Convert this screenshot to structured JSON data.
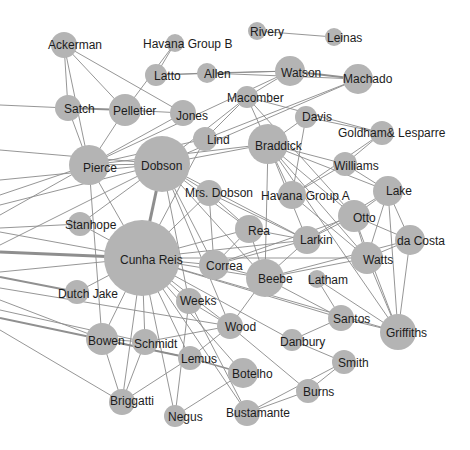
{
  "chart_data": {
    "type": "network",
    "title": "",
    "node_color": "#b4b4b4",
    "edge_color": "#8a8a8a",
    "label_color": "#1c1c1c",
    "nodes": [
      {
        "id": "Ackerman",
        "x": 64,
        "y": 45,
        "r": 13,
        "lx": 48,
        "ly": 49
      },
      {
        "id": "Havana Group B",
        "x": 175,
        "y": 43,
        "r": 9,
        "lx": 143,
        "ly": 48
      },
      {
        "id": "Rivery",
        "x": 257,
        "y": 31,
        "r": 9,
        "lx": 250,
        "ly": 36
      },
      {
        "id": "Leinas",
        "x": 334,
        "y": 37,
        "r": 9,
        "lx": 327,
        "ly": 42
      },
      {
        "id": "Latto",
        "x": 156,
        "y": 75,
        "r": 11,
        "lx": 154,
        "ly": 80
      },
      {
        "id": "Allen",
        "x": 207,
        "y": 73,
        "r": 10,
        "lx": 204,
        "ly": 78
      },
      {
        "id": "Watson",
        "x": 290,
        "y": 71,
        "r": 15,
        "lx": 281,
        "ly": 77
      },
      {
        "id": "Machado",
        "x": 358,
        "y": 79,
        "r": 15,
        "lx": 343,
        "ly": 83
      },
      {
        "id": "Satch",
        "x": 68,
        "y": 108,
        "r": 13,
        "lx": 64,
        "ly": 113
      },
      {
        "id": "Pelletier",
        "x": 125,
        "y": 110,
        "r": 16,
        "lx": 113,
        "ly": 115
      },
      {
        "id": "Jones",
        "x": 183,
        "y": 113,
        "r": 13,
        "lx": 176,
        "ly": 120
      },
      {
        "id": "Macomber",
        "x": 247,
        "y": 97,
        "r": 11,
        "lx": 227,
        "ly": 102
      },
      {
        "id": "Lind",
        "x": 205,
        "y": 139,
        "r": 12,
        "lx": 207,
        "ly": 144
      },
      {
        "id": "Davis",
        "x": 306,
        "y": 117,
        "r": 11,
        "lx": 302,
        "ly": 121
      },
      {
        "id": "Goldham& Lesparre",
        "x": 382,
        "y": 133,
        "r": 12,
        "lx": 338,
        "ly": 137
      },
      {
        "id": "Pierce",
        "x": 89,
        "y": 165,
        "r": 20,
        "lx": 83,
        "ly": 172
      },
      {
        "id": "Dobson",
        "x": 162,
        "y": 164,
        "r": 28,
        "lx": 141,
        "ly": 170
      },
      {
        "id": "Braddick",
        "x": 268,
        "y": 144,
        "r": 20,
        "lx": 255,
        "ly": 150
      },
      {
        "id": "Williams",
        "x": 345,
        "y": 164,
        "r": 12,
        "lx": 334,
        "ly": 170
      },
      {
        "id": "Mrs. Dobson",
        "x": 209,
        "y": 193,
        "r": 13,
        "lx": 185,
        "ly": 197
      },
      {
        "id": "Havana Group A",
        "x": 292,
        "y": 195,
        "r": 14,
        "lx": 261,
        "ly": 200
      },
      {
        "id": "Lake",
        "x": 388,
        "y": 191,
        "r": 15,
        "lx": 386,
        "ly": 195
      },
      {
        "id": "Stanhope",
        "x": 80,
        "y": 224,
        "r": 12,
        "lx": 65,
        "ly": 229
      },
      {
        "id": "Rea",
        "x": 249,
        "y": 229,
        "r": 14,
        "lx": 248,
        "ly": 235
      },
      {
        "id": "Otto",
        "x": 354,
        "y": 216,
        "r": 16,
        "lx": 353,
        "ly": 222
      },
      {
        "id": "Larkin",
        "x": 307,
        "y": 240,
        "r": 14,
        "lx": 300,
        "ly": 244
      },
      {
        "id": "da Costa",
        "x": 410,
        "y": 240,
        "r": 15,
        "lx": 397,
        "ly": 245
      },
      {
        "id": "Cunha Reis",
        "x": 142,
        "y": 258,
        "r": 38,
        "lx": 120,
        "ly": 264
      },
      {
        "id": "Correa",
        "x": 214,
        "y": 265,
        "r": 15,
        "lx": 206,
        "ly": 270
      },
      {
        "id": "Watts",
        "x": 367,
        "y": 258,
        "r": 16,
        "lx": 363,
        "ly": 264
      },
      {
        "id": "Beebe",
        "x": 265,
        "y": 278,
        "r": 19,
        "lx": 258,
        "ly": 283
      },
      {
        "id": "Latham",
        "x": 317,
        "y": 279,
        "r": 9,
        "lx": 308,
        "ly": 284
      },
      {
        "id": "Dutch Jake",
        "x": 77,
        "y": 292,
        "r": 12,
        "lx": 58,
        "ly": 298
      },
      {
        "id": "Weeks",
        "x": 189,
        "y": 301,
        "r": 13,
        "lx": 180,
        "ly": 305
      },
      {
        "id": "Santos",
        "x": 341,
        "y": 318,
        "r": 13,
        "lx": 333,
        "ly": 323
      },
      {
        "id": "Griffiths",
        "x": 398,
        "y": 332,
        "r": 18,
        "lx": 386,
        "ly": 337
      },
      {
        "id": "Wood",
        "x": 230,
        "y": 326,
        "r": 13,
        "lx": 225,
        "ly": 331
      },
      {
        "id": "Danbury",
        "x": 292,
        "y": 340,
        "r": 11,
        "lx": 280,
        "ly": 346
      },
      {
        "id": "Bowen",
        "x": 102,
        "y": 339,
        "r": 16,
        "lx": 88,
        "ly": 345
      },
      {
        "id": "Schmidt",
        "x": 145,
        "y": 342,
        "r": 13,
        "lx": 134,
        "ly": 348
      },
      {
        "id": "Lemus",
        "x": 190,
        "y": 358,
        "r": 12,
        "lx": 181,
        "ly": 363
      },
      {
        "id": "Smith",
        "x": 344,
        "y": 362,
        "r": 12,
        "lx": 338,
        "ly": 367
      },
      {
        "id": "Botelho",
        "x": 243,
        "y": 373,
        "r": 15,
        "lx": 232,
        "ly": 378
      },
      {
        "id": "Burns",
        "x": 308,
        "y": 391,
        "r": 12,
        "lx": 303,
        "ly": 396
      },
      {
        "id": "Briggatti",
        "x": 122,
        "y": 402,
        "r": 13,
        "lx": 110,
        "ly": 405
      },
      {
        "id": "Negus",
        "x": 175,
        "y": 416,
        "r": 11,
        "lx": 168,
        "ly": 421
      },
      {
        "id": "Bustamante",
        "x": 247,
        "y": 413,
        "r": 13,
        "lx": 226,
        "ly": 417
      }
    ],
    "edges": [
      [
        "Rivery",
        "Leinas",
        1
      ],
      [
        "Latto",
        "Allen",
        1
      ],
      [
        "Allen",
        "Watson",
        1
      ],
      [
        "Latto",
        "Watson",
        1
      ],
      [
        "Watson",
        "Machado",
        2
      ],
      [
        "Allen",
        "Machado",
        1
      ],
      [
        "Havana Group B",
        "Latto",
        1
      ],
      [
        "Havana Group B",
        "Pelletier",
        1
      ],
      [
        "Ackerman",
        "Satch",
        1
      ],
      [
        "Ackerman",
        "Pelletier",
        1
      ],
      [
        "Ackerman",
        "Jones",
        1
      ],
      [
        "Ackerman",
        "Pierce",
        1
      ],
      [
        "Satch",
        "Pelletier",
        2
      ],
      [
        "Pelletier",
        "Jones",
        1
      ],
      [
        "Pelletier",
        "Pierce",
        1
      ],
      [
        "Satch",
        "Pierce",
        1
      ],
      [
        "LEFT:0,105",
        "Satch",
        1
      ],
      [
        "Jones",
        "Pierce",
        1
      ],
      [
        "Macomber",
        "Watson",
        1
      ],
      [
        "Macomber",
        "Braddick",
        1
      ],
      [
        "Macomber",
        "Dobson",
        1
      ],
      [
        "Macomber",
        "Lind",
        1
      ],
      [
        "Macomber",
        "Goldham& Lesparre",
        1
      ],
      [
        "Macomber",
        "Otto",
        1
      ],
      [
        "Machado",
        "Dobson",
        1
      ],
      [
        "Machado",
        "Lind",
        1
      ],
      [
        "Watson",
        "Pierce",
        1
      ],
      [
        "Lind",
        "Pierce",
        1
      ],
      [
        "Lind",
        "Cunha Reis",
        1
      ],
      [
        "Braddick",
        "Dobson",
        1
      ],
      [
        "Braddick",
        "Pierce",
        1
      ],
      [
        "Braddick",
        "Davis",
        1
      ],
      [
        "Braddick",
        "Williams",
        1
      ],
      [
        "Braddick",
        "Havana Group A",
        1
      ],
      [
        "Braddick",
        "Otto",
        1
      ],
      [
        "Braddick",
        "Larkin",
        1
      ],
      [
        "Braddick",
        "Watts",
        1
      ],
      [
        "Braddick",
        "Beebe",
        1
      ],
      [
        "Braddick",
        "Lake",
        1
      ],
      [
        "Braddick",
        "Griffiths",
        1
      ],
      [
        "Davis",
        "Goldham& Lesparre",
        1
      ],
      [
        "Davis",
        "Havana Group A",
        1
      ],
      [
        "Goldham& Lesparre",
        "Havana Group A",
        1
      ],
      [
        "Goldham& Lesparre",
        "Williams",
        1
      ],
      [
        "Williams",
        "Havana Group A",
        1
      ],
      [
        "Williams",
        "Lake",
        1
      ],
      [
        "Dobson",
        "Cunha Reis",
        3
      ],
      [
        "Dobson",
        "Pierce",
        1
      ],
      [
        "Dobson",
        "Mrs. Dobson",
        1
      ],
      [
        "Dobson",
        "Rea",
        1
      ],
      [
        "Dobson",
        "Correa",
        1
      ],
      [
        "Dobson",
        "Larkin",
        1
      ],
      [
        "Dobson",
        "Beebe",
        1
      ],
      [
        "Dobson",
        "Weeks",
        1
      ],
      [
        "Dobson",
        "Stanhope",
        1
      ],
      [
        "Dobson",
        "Wood",
        1
      ],
      [
        "LEFT:0,150",
        "Dobson",
        1
      ],
      [
        "LEFT:0,180",
        "Dobson",
        1
      ],
      [
        "LEFT:0,195",
        "Pierce",
        1
      ],
      [
        "LEFT:0,205",
        "Dobson",
        1
      ],
      [
        "LEFT:0,215",
        "Pierce",
        1
      ],
      [
        "LEFT:0,245",
        "Dobson",
        1
      ],
      [
        "Pierce",
        "Cunha Reis",
        1
      ],
      [
        "Pierce",
        "Bowen",
        1
      ],
      [
        "Mrs. Dobson",
        "Correa",
        1
      ],
      [
        "Mrs. Dobson",
        "Rea",
        1
      ],
      [
        "Mrs. Dobson",
        "Larkin",
        1
      ],
      [
        "Mrs. Dobson",
        "Cunha Reis",
        1
      ],
      [
        "Stanhope",
        "Cunha Reis",
        1
      ],
      [
        "LEFT:0,228",
        "Stanhope",
        1
      ],
      [
        "LEFT:0,232",
        "Cunha Reis",
        1
      ],
      [
        "LEFT:0,252",
        "Cunha Reis",
        3
      ],
      [
        "LEFT:0,272",
        "Cunha Reis",
        1
      ],
      [
        "LEFT:0,277",
        "Dutch Jake",
        2
      ],
      [
        "LEFT:0,300",
        "Bowen",
        1
      ],
      [
        "LEFT:0,310",
        "Schmidt",
        1
      ],
      [
        "LEFT:0,318",
        "Lemus",
        2
      ],
      [
        "LEFT:0,330",
        "Briggatti",
        1
      ],
      [
        "LEFT:0,288",
        "Wood",
        1
      ],
      [
        "Dutch Jake",
        "Cunha Reis",
        1
      ],
      [
        "Cunha Reis",
        "Correa",
        1
      ],
      [
        "Cunha Reis",
        "Rea",
        1
      ],
      [
        "Cunha Reis",
        "Larkin",
        1
      ],
      [
        "Cunha Reis",
        "Beebe",
        1
      ],
      [
        "Cunha Reis",
        "Weeks",
        1
      ],
      [
        "Cunha Reis",
        "Wood",
        1
      ],
      [
        "Cunha Reis",
        "Bowen",
        1
      ],
      [
        "Cunha Reis",
        "Schmidt",
        1
      ],
      [
        "Cunha Reis",
        "Lemus",
        1
      ],
      [
        "Cunha Reis",
        "Botelho",
        1
      ],
      [
        "Cunha Reis",
        "Briggatti",
        1
      ],
      [
        "Cunha Reis",
        "Negus",
        1
      ],
      [
        "Cunha Reis",
        "Danbury",
        1
      ],
      [
        "Cunha Reis",
        "Santos",
        1
      ],
      [
        "Cunha Reis",
        "Bustamante",
        1
      ],
      [
        "Cunha Reis",
        "Watts",
        1
      ],
      [
        "Cunha Reis",
        "Griffiths",
        1
      ],
      [
        "Correa",
        "Rea",
        1
      ],
      [
        "Correa",
        "Larkin",
        1
      ],
      [
        "Correa",
        "Beebe",
        1
      ],
      [
        "Correa",
        "Otto",
        1
      ],
      [
        "Rea",
        "Larkin",
        1
      ],
      [
        "Rea",
        "Beebe",
        1
      ],
      [
        "Larkin",
        "Otto",
        1
      ],
      [
        "Larkin",
        "Lake",
        1
      ],
      [
        "Larkin",
        "Beebe",
        1
      ],
      [
        "Havana Group A",
        "Watts",
        1
      ],
      [
        "Otto",
        "Watts",
        1
      ],
      [
        "Otto",
        "da Costa",
        1
      ],
      [
        "Otto",
        "Lake",
        1
      ],
      [
        "Otto",
        "Griffiths",
        1
      ],
      [
        "Lake",
        "Watts",
        1
      ],
      [
        "Lake",
        "da Costa",
        1
      ],
      [
        "Lake",
        "Griffiths",
        1
      ],
      [
        "da Costa",
        "Watts",
        1
      ],
      [
        "da Costa",
        "Griffiths",
        1
      ],
      [
        "da Costa",
        "Beebe",
        1
      ],
      [
        "Watts",
        "Beebe",
        1
      ],
      [
        "Watts",
        "Griffiths",
        1
      ],
      [
        "Beebe",
        "Santos",
        1
      ],
      [
        "Beebe",
        "Wood",
        1
      ],
      [
        "Latham",
        "Santos",
        1
      ],
      [
        "Latham",
        "Griffiths",
        1
      ],
      [
        "Santos",
        "Griffiths",
        1
      ],
      [
        "Santos",
        "Danbury",
        1
      ],
      [
        "Danbury",
        "Smith",
        1
      ],
      [
        "Weeks",
        "Wood",
        1
      ],
      [
        "Weeks",
        "Negus",
        1
      ],
      [
        "Weeks",
        "Bustamante",
        1
      ],
      [
        "Wood",
        "Burns",
        1
      ],
      [
        "Wood",
        "Lemus",
        1
      ],
      [
        "Wood",
        "Schmidt",
        1
      ],
      [
        "Bowen",
        "Schmidt",
        1
      ],
      [
        "Bowen",
        "Lemus",
        1
      ],
      [
        "Bowen",
        "Briggatti",
        1
      ],
      [
        "Schmidt",
        "Briggatti",
        1
      ],
      [
        "Lemus",
        "Botelho",
        2
      ],
      [
        "Lemus",
        "Briggatti",
        1
      ],
      [
        "Botelho",
        "Negus",
        1
      ],
      [
        "Smith",
        "Burns",
        1
      ],
      [
        "Smith",
        "Bustamante",
        1
      ],
      [
        "Burns",
        "Bustamante",
        1
      ]
    ]
  }
}
